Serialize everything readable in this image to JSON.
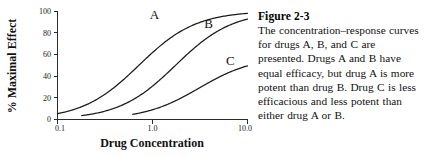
{
  "figure": {
    "caption_title": "Figure 2-3",
    "caption_body": "The concentration–response curves for drugs A, B, and C are presented. Drugs A and B have equal efficacy, but drug A is more potent than drug B. Drug C is less efficacious and less potent than either drug A or B."
  },
  "chart_data": {
    "type": "line",
    "title": "",
    "xlabel": "Drug Concentration",
    "ylabel": "% Maximal Effect",
    "x_scale": "log",
    "xlim": [
      0.1,
      10.0
    ],
    "ylim": [
      0,
      100
    ],
    "x_ticks": [
      "0.1",
      "1.0",
      "10.0"
    ],
    "x_tick_values": [
      0.1,
      1.0,
      10.0
    ],
    "y_ticks": [
      "0",
      "20",
      "40",
      "60",
      "80",
      "100"
    ],
    "y_tick_values": [
      0,
      20,
      40,
      60,
      80,
      100
    ],
    "grid": false,
    "legend": "inline-curve-labels",
    "series": [
      {
        "name": "A",
        "label": "A",
        "emax": 100,
        "ec50": 0.72,
        "hill": 1.45,
        "label_x": 1.05,
        "label_y": 93,
        "x": [
          0.1,
          0.15,
          0.22,
          0.32,
          0.47,
          0.68,
          1.0,
          1.5,
          2.2,
          3.2,
          4.7,
          6.8,
          10.0
        ],
        "y": [
          2,
          4,
          8,
          16,
          31,
          49,
          66,
          80,
          89,
          94,
          97,
          99,
          100
        ]
      },
      {
        "name": "B",
        "label": "B",
        "emax": 100,
        "ec50": 1.75,
        "hill": 1.45,
        "label_x": 3.9,
        "label_y": 84,
        "x": [
          0.18,
          0.26,
          0.38,
          0.55,
          0.8,
          1.2,
          1.75,
          2.6,
          3.8,
          5.5,
          8.0,
          10.0
        ],
        "y": [
          2,
          4,
          8,
          16,
          29,
          44,
          60,
          75,
          85,
          92,
          96,
          97
        ]
      },
      {
        "name": "C",
        "label": "C",
        "emax": 58,
        "ec50": 3.1,
        "hill": 1.5,
        "label_x": 6.6,
        "label_y": 50,
        "x": [
          0.62,
          0.85,
          1.15,
          1.6,
          2.2,
          3.1,
          4.3,
          6.0,
          8.2,
          10.0
        ],
        "y": [
          1,
          3,
          7,
          14,
          24,
          34,
          45,
          52,
          56,
          57
        ]
      }
    ]
  },
  "colors": {
    "curve": "#1a1a1a",
    "axis": "#2b2b2b",
    "background": "#ffffff",
    "text": "#111111"
  }
}
